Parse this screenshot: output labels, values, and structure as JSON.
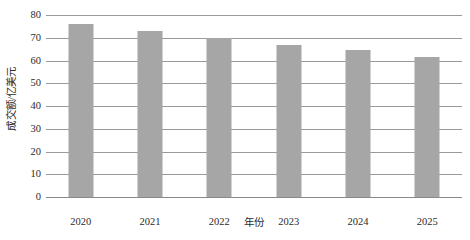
{
  "chart_data": {
    "type": "bar",
    "title": "",
    "subtitle": "",
    "xlabel": "年份",
    "ylabel": "成交额/亿美元",
    "categories": [
      "2020",
      "2021",
      "2022",
      "2023",
      "2024",
      "2025"
    ],
    "values": [
      76,
      73,
      70,
      67,
      64.5,
      61.5
    ],
    "series": [
      {
        "name": "成交额",
        "values": [
          76,
          73,
          70,
          67,
          64.5,
          61.5
        ]
      }
    ],
    "ylim": [
      0,
      80
    ],
    "ytick_labels": [
      "0",
      "10",
      "20",
      "30",
      "40",
      "50",
      "60",
      "70",
      "80"
    ],
    "ytick_values": [
      0,
      10,
      20,
      30,
      40,
      50,
      60,
      70,
      80
    ],
    "grid": true,
    "grid_axis": "y",
    "legend": false,
    "legend_position": "none",
    "bar_color": "#a6a6a6",
    "grid_color": "#9a9a9a",
    "axis_color": "#8a8a8a",
    "background_color": "#ffffff",
    "text_color": "#2b2b2b"
  }
}
